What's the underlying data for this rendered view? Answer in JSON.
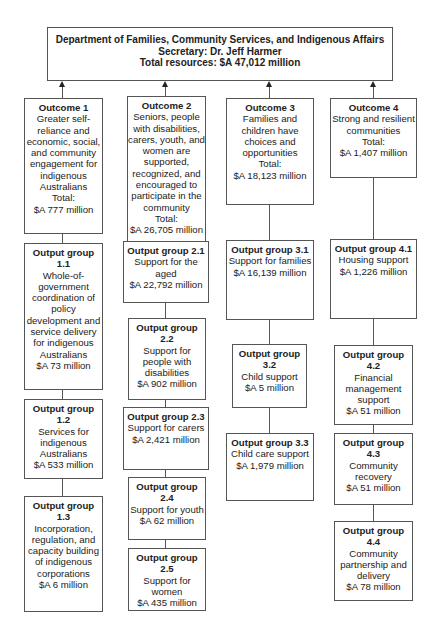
{
  "department": {
    "title": "Department of Families, Community Services, and Indigenous Affairs",
    "secretary": "Secretary: Dr. Jeff Harmer",
    "total": "Total resources: $A 47,012 million"
  },
  "outcomes": [
    {
      "heading": "Outcome 1",
      "description": "Greater self-reliance and economic, social, and community engagement for indigenous Australians",
      "total_label": "Total:",
      "amount": "$A 777 million",
      "output_groups": [
        {
          "heading": "Output group 1.1",
          "description": "Whole-of-government coordination of policy development and service delivery for indigenous Australians",
          "amount": "$A 73 million"
        },
        {
          "heading": "Output group 1.2",
          "description": "Services for indigenous Australians",
          "amount": "$A 533 million"
        },
        {
          "heading": "Output group 1.3",
          "description": "Incorporation, regulation, and capacity building of indigenous corporations",
          "amount": "$A 6 million"
        }
      ]
    },
    {
      "heading": "Outcome 2",
      "description": "Seniors, people with disabilities, carers, youth, and women are supported, recognized, and encouraged to participate in the community",
      "total_label": "Total:",
      "amount": "$A 26,705 million",
      "output_groups": [
        {
          "heading": "Output group 2.1",
          "description": "Support for the aged",
          "amount": "$A 22,792 million"
        },
        {
          "heading": "Output group 2.2",
          "description": "Support for people with disabilities",
          "amount": "$A 902 million"
        },
        {
          "heading": "Output group 2.3",
          "description": "Support for carers",
          "amount": "$A 2,421 million"
        },
        {
          "heading": "Output group 2.4",
          "description": "Support for youth",
          "amount": "$A 62 million"
        },
        {
          "heading": "Output group 2.5",
          "description": "Support for women",
          "amount": "$A 435 million"
        }
      ]
    },
    {
      "heading": "Outcome 3",
      "description": "Families and children have choices and opportunities",
      "total_label": "Total:",
      "amount": "$A 18,123 million",
      "output_groups": [
        {
          "heading": "Output group 3.1",
          "description": "Support for families",
          "amount": "$A 16,139 million"
        },
        {
          "heading": "Output group 3.2",
          "description": "Child support",
          "amount": "$A 5 million"
        },
        {
          "heading": "Output group 3.3",
          "description": "Child care support",
          "amount": "$A 1,979 million"
        }
      ]
    },
    {
      "heading": "Outcome 4",
      "description": "Strong and resilient communities",
      "total_label": "Total:",
      "amount": "$A 1,407 million",
      "output_groups": [
        {
          "heading": "Output group 4.1",
          "description": "Housing support",
          "amount": "$A 1,226 million"
        },
        {
          "heading": "Output group 4.2",
          "description": "Financial management support",
          "amount": "$A 51 million"
        },
        {
          "heading": "Output group 4.3",
          "description": "Community recovery",
          "amount": "$A 51 million"
        },
        {
          "heading": "Output group 4.4",
          "description": "Community partnership and delivery",
          "amount": "$A 78 million"
        }
      ]
    }
  ]
}
